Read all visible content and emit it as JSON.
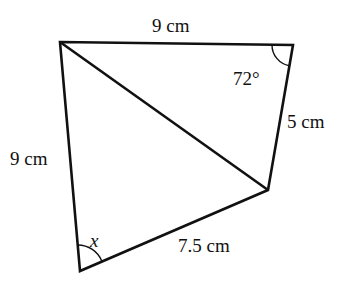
{
  "figure": {
    "type": "quadrilateral with diagonal",
    "vertices": {
      "A": [
        60,
        42
      ],
      "B": [
        293,
        45
      ],
      "C": [
        268,
        190
      ],
      "D": [
        80,
        271
      ]
    },
    "labels": {
      "top_side": "9 cm",
      "right_side": "5 cm",
      "left_side": "9 cm",
      "bottom_side": "7.5 cm",
      "angle_B": "72°",
      "angle_D": "x"
    },
    "stroke_color": "#111111"
  }
}
